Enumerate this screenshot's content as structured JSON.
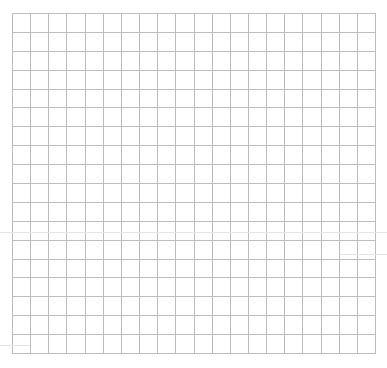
{
  "grid": {
    "columns": 20,
    "rows": 18,
    "line_color": "#bdbdbd",
    "background": "#ffffff"
  },
  "artifacts": [
    {
      "x": 0,
      "y": 232,
      "w": 387
    },
    {
      "x": 0,
      "y": 345,
      "w": 30
    },
    {
      "x": 340,
      "y": 254,
      "w": 47
    }
  ]
}
